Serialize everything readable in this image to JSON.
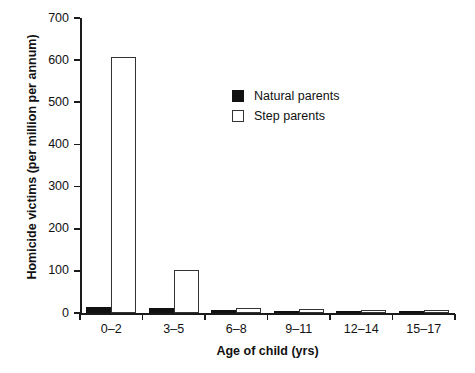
{
  "chart_data": {
    "type": "bar",
    "title": "",
    "xlabel": "Age of child (yrs)",
    "ylabel": "Homicide victims (per million per annum)",
    "categories": [
      "0–2",
      "3–5",
      "6–8",
      "9–11",
      "12–14",
      "15–17"
    ],
    "series": [
      {
        "name": "Natural parents",
        "color": "#111111",
        "values": [
          14,
          11,
          7,
          2,
          1,
          1
        ]
      },
      {
        "name": "Step parents",
        "color": "#ffffff",
        "values": [
          607,
          102,
          12,
          9,
          7,
          6
        ]
      }
    ],
    "ylim": [
      0,
      700
    ],
    "yticks": [
      0,
      100,
      200,
      300,
      400,
      500,
      600,
      700
    ],
    "ytick_labels": [
      "0",
      "100",
      "200",
      "300",
      "400",
      "500",
      "600",
      "700"
    ],
    "grid": false,
    "legend_position": "upper-center-right"
  },
  "legend": {
    "entries": [
      {
        "label": "Natural parents",
        "style": "filled"
      },
      {
        "label": "Step parents",
        "style": "hollow"
      }
    ]
  }
}
